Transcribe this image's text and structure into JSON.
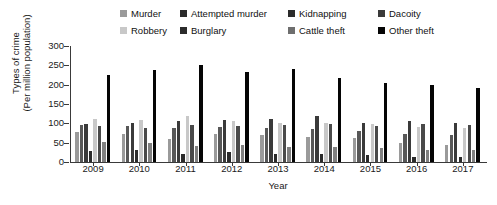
{
  "chart_data": {
    "type": "bar",
    "title": "",
    "xlabel": "Year",
    "ylabel": "Types of crime (Per million population)",
    "ylabel_line1": "Types of crime",
    "ylabel_line2": "(Per million population)",
    "ylim": [
      0,
      300
    ],
    "yticks": [
      0,
      50,
      100,
      150,
      200,
      250,
      300
    ],
    "grid": false,
    "legend_position": "top",
    "categories": [
      "2009",
      "2010",
      "2011",
      "2012",
      "2013",
      "2014",
      "2015",
      "2016",
      "2017"
    ],
    "series": [
      {
        "name": "Murder",
        "color": "#9a9a9a",
        "values": [
          78,
          72,
          60,
          72,
          70,
          65,
          62,
          48,
          45
        ]
      },
      {
        "name": "Attempted murder",
        "color": "#585858",
        "values": [
          95,
          92,
          88,
          90,
          88,
          85,
          80,
          72,
          70
        ]
      },
      {
        "name": "Kidnapping",
        "color": "#3a3a3a",
        "values": [
          98,
          100,
          105,
          108,
          112,
          118,
          100,
          105,
          100
        ]
      },
      {
        "name": "Dacoity",
        "color": "#2b2b2b",
        "values": [
          28,
          30,
          22,
          25,
          22,
          20,
          18,
          14,
          12
        ]
      },
      {
        "name": "Robbery",
        "color": "#c8c8c8",
        "values": [
          112,
          108,
          118,
          105,
          102,
          100,
          98,
          90,
          88
        ]
      },
      {
        "name": "Burglary",
        "color": "#4a4a4a",
        "values": [
          92,
          88,
          95,
          92,
          95,
          98,
          92,
          98,
          95
        ]
      },
      {
        "name": "Cattle theft",
        "color": "#808080",
        "values": [
          52,
          48,
          42,
          45,
          40,
          38,
          35,
          32,
          30
        ]
      },
      {
        "name": "Other theft",
        "color": "#050505",
        "values": [
          225,
          238,
          250,
          232,
          240,
          218,
          205,
          198,
          192
        ]
      }
    ]
  },
  "legend": {
    "rows": [
      [
        {
          "label": "Murder",
          "swatch": "#9a9a9a",
          "left": 120
        },
        {
          "label": "Attempted murder",
          "swatch": "#2b2b2b",
          "left": 180
        },
        {
          "label": "Kidnapping",
          "swatch": "#2b2b2b",
          "left": 288
        },
        {
          "label": "Dacoity",
          "swatch": "#3a3a3a",
          "left": 378
        }
      ],
      [
        {
          "label": "Robbery",
          "swatch": "#c8c8c8",
          "left": 120
        },
        {
          "label": "Burglary",
          "swatch": "#2b2b2b",
          "left": 180
        },
        {
          "label": "Cattle theft",
          "swatch": "#6e6e6e",
          "left": 288
        },
        {
          "label": "Other theft",
          "swatch": "#050505",
          "left": 378
        }
      ]
    ]
  },
  "axis": {
    "y_tick_labels": [
      "300",
      "250",
      "200",
      "150",
      "100",
      "50",
      "0"
    ],
    "x_tick_labels": [
      "2009",
      "2010",
      "2011",
      "2012",
      "2013",
      "2014",
      "2015",
      "2016",
      "2017"
    ],
    "x_title": "Year"
  }
}
